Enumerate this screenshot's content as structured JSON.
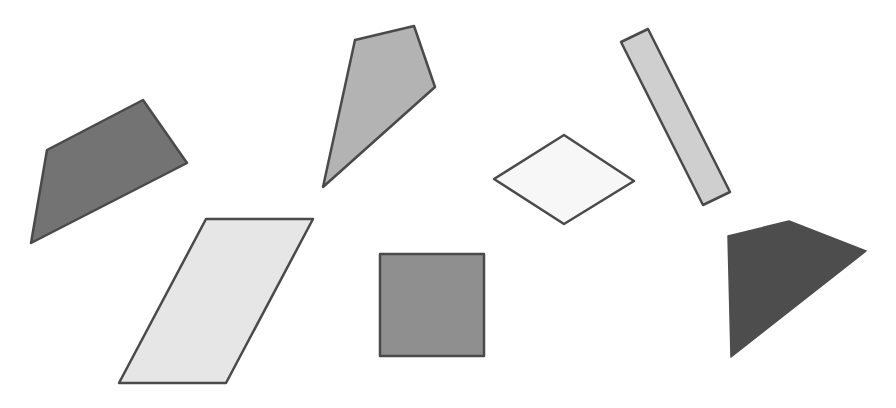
{
  "canvas": {
    "width": 896,
    "height": 408,
    "background": "#ffffff"
  },
  "shapes": [
    {
      "name": "dark-quadrilateral-left",
      "type": "quadrilateral",
      "fill": "#737373",
      "stroke": "#4a4a4a",
      "points": "47,150 143,100 187,163 31,243"
    },
    {
      "name": "kite",
      "type": "kite",
      "fill": "#b3b3b3",
      "stroke": "#4a4a4a",
      "points": "355,40 414,26 435,87 323,187"
    },
    {
      "name": "thin-rectangle",
      "type": "rectangle",
      "fill": "#cfcfcf",
      "stroke": "#4a4a4a",
      "points": "621,42 648,29 730,192 703,205"
    },
    {
      "name": "rhombus",
      "type": "rhombus",
      "fill": "#f7f7f7",
      "stroke": "#4a4a4a",
      "points": "564,135 634,181 564,224 494,179"
    },
    {
      "name": "parallelogram",
      "type": "parallelogram",
      "fill": "#e6e6e6",
      "stroke": "#4a4a4a",
      "points": "206,219 313,219 226,383 119,383"
    },
    {
      "name": "square",
      "type": "square",
      "fill": "#8f8f8f",
      "stroke": "#4a4a4a",
      "points": "380,254 484,254 484,356 380,356"
    },
    {
      "name": "dark-quadrilateral-right",
      "type": "quadrilateral",
      "fill": "#4d4d4d",
      "stroke": "#4d4d4d",
      "points": "728,236 789,221 866,251 731,357"
    }
  ]
}
